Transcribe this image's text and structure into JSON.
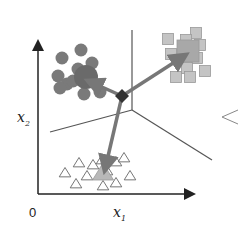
{
  "diagram": {
    "type": "cluster-prototype-illustration",
    "axes": {
      "x_label": "x",
      "x_sub": "1",
      "y_label": "x",
      "y_sub": "2",
      "origin_label": "0"
    },
    "colors": {
      "axis": "#222222",
      "circle_fill": "#7a7a7a",
      "circle_center_fill": "#6a6a6a",
      "square_fill": "#c4c4c4",
      "square_stroke": "#9a9a9a",
      "square_center_fill": "#a8a8a8",
      "triangle_stroke": "#666666",
      "triangle_center_fill": "#b8b8b8",
      "arrow": "#777777",
      "plane_line": "#555555",
      "junction": "#333333"
    },
    "clusters": [
      {
        "name": "circles",
        "center": [
          86,
          77,
          12
        ],
        "points": [
          [
            62,
            58
          ],
          [
            81,
            50
          ],
          [
            92,
            63
          ],
          [
            58,
            76
          ],
          [
            67,
            84
          ],
          [
            73,
            81
          ],
          [
            100,
            92
          ],
          [
            84,
            94
          ],
          [
            60,
            88
          ],
          [
            78,
            69
          ]
        ]
      },
      {
        "name": "squares",
        "center": [
          188,
          51,
          11
        ],
        "points": [
          [
            168,
            39
          ],
          [
            196,
            33
          ],
          [
            200,
            45
          ],
          [
            186,
            40
          ],
          [
            171,
            54
          ],
          [
            197,
            58
          ],
          [
            187,
            68
          ],
          [
            176,
            77
          ],
          [
            190,
            77
          ],
          [
            205,
            71
          ]
        ]
      },
      {
        "name": "triangles",
        "center": [
          103,
          173
        ],
        "points": [
          [
            79,
            163
          ],
          [
            93,
            165
          ],
          [
            116,
            162
          ],
          [
            124,
            158
          ],
          [
            65,
            173
          ],
          [
            87,
            176
          ],
          [
            102,
            160
          ],
          [
            130,
            176
          ],
          [
            76,
            184
          ],
          [
            103,
            186
          ],
          [
            116,
            183
          ],
          [
            107,
            171
          ]
        ]
      }
    ],
    "junction": [
      122,
      96
    ],
    "side_label": "<"
  }
}
